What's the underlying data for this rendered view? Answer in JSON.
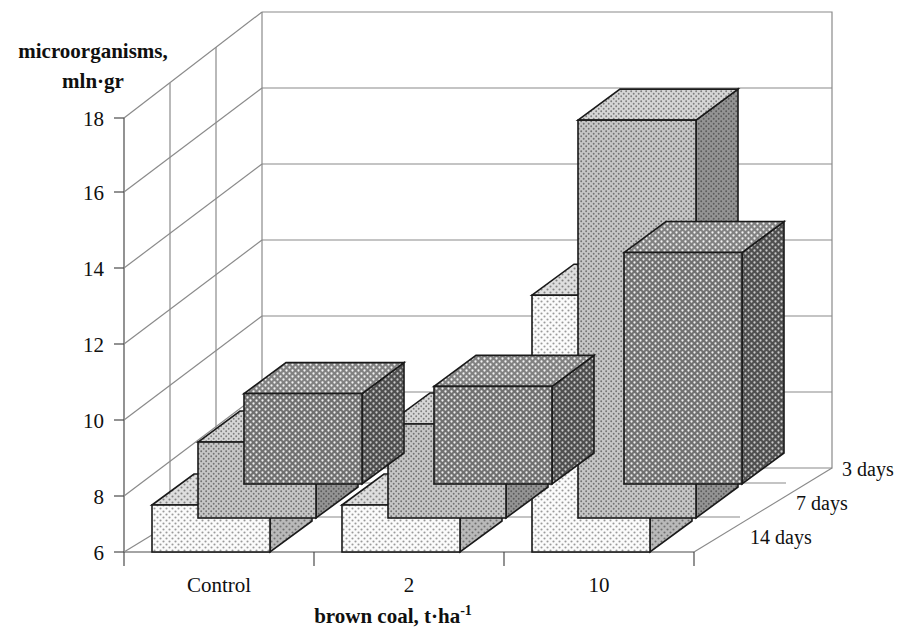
{
  "chart_data": {
    "type": "bar",
    "subtype": "3d-clustered-column",
    "title": "",
    "xlabel": "brown coal, t·ha⁻¹",
    "ylabel": "microorganisms, mln·gr",
    "zlabel": "",
    "categories": [
      "Control",
      "2",
      "10"
    ],
    "series": [
      {
        "name": "3 days",
        "values": [
          8.5,
          8.7,
          12.4
        ]
      },
      {
        "name": "7 days",
        "values": [
          8.1,
          8.6,
          17.0
        ]
      },
      {
        "name": "14 days",
        "values": [
          7.3,
          7.3,
          13.1
        ]
      }
    ],
    "ylim": [
      6,
      18
    ],
    "yticks": [
      6,
      8,
      10,
      12,
      14,
      16,
      18
    ],
    "ytick_labels": [
      "6",
      "8",
      "10",
      "12",
      "14",
      "16",
      "18"
    ],
    "grid": true,
    "grid_axis": "y",
    "legend": "depth-axis-right",
    "depth_order_front_to_back": [
      "14 days",
      "7 days",
      "3 days"
    ]
  },
  "axes": {
    "y_title_line1": "microorganisms,",
    "y_title_line2": "mln·gr",
    "x_title_main": "brown coal, t·ha",
    "x_title_superscript": "-1"
  },
  "yticks": {
    "t18": "18",
    "t16": "16",
    "t14": "14",
    "t12": "12",
    "t10": "10",
    "t8": "8",
    "t6": "6"
  },
  "categories": {
    "c0": "Control",
    "c1": "2",
    "c2": "10"
  },
  "series_labels": {
    "s_back": "3 days",
    "s_mid": "7 days",
    "s_front": "14 days"
  },
  "colors": {
    "background": "#ffffff",
    "axis_line": "#4a4a4a",
    "grid_line": "#8a8a8a",
    "bar_outline": "#1a1a1a",
    "series_3days_front": "#6e6e6e",
    "series_3days_top": "#8a8a8a",
    "series_3days_side": "#4d4d4d",
    "series_7days_front": "#bdbdbd",
    "series_7days_top": "#cfcfcf",
    "series_7days_side": "#8f8f8f",
    "series_14days_front": "#f0f0f0",
    "series_14days_top": "#d9d9d9",
    "series_14days_side": "#b5b5b5",
    "text": "#101010"
  }
}
